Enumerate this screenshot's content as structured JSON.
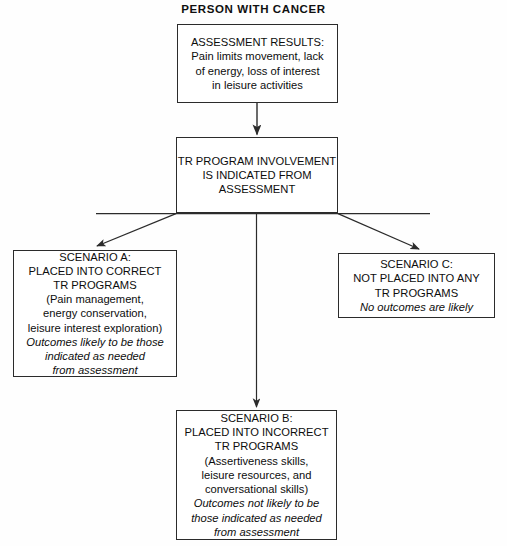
{
  "diagram": {
    "title": "PERSON WITH CANCER",
    "type": "flowchart",
    "nodes": {
      "assessment": {
        "id": "assessment-results",
        "lines": [
          {
            "text": "ASSESSMENT RESULTS:",
            "style": "normal"
          },
          {
            "text": "Pain limits movement, lack",
            "style": "normal"
          },
          {
            "text": "of energy, loss of interest",
            "style": "normal"
          },
          {
            "text": "in leisure activities",
            "style": "normal"
          }
        ]
      },
      "involvement": {
        "id": "tr-program-involvement",
        "lines": [
          {
            "text": "TR PROGRAM INVOLVEMENT",
            "style": "normal"
          },
          {
            "text": "IS INDICATED FROM",
            "style": "normal"
          },
          {
            "text": "ASSESSMENT",
            "style": "normal"
          }
        ]
      },
      "scenario_a": {
        "id": "scenario-a",
        "lines": [
          {
            "text": "SCENARIO A:",
            "style": "normal"
          },
          {
            "text": "PLACED INTO CORRECT",
            "style": "normal"
          },
          {
            "text": "TR PROGRAMS",
            "style": "normal"
          },
          {
            "text": "(Pain management,",
            "style": "normal"
          },
          {
            "text": "energy conservation,",
            "style": "normal"
          },
          {
            "text": "leisure interest exploration)",
            "style": "normal"
          },
          {
            "text": "Outcomes likely to be those",
            "style": "italic"
          },
          {
            "text": "indicated as needed",
            "style": "italic"
          },
          {
            "text": "from assessment",
            "style": "italic"
          }
        ]
      },
      "scenario_b": {
        "id": "scenario-b",
        "lines": [
          {
            "text": "SCENARIO B:",
            "style": "normal"
          },
          {
            "text": "PLACED INTO INCORRECT",
            "style": "normal"
          },
          {
            "text": "TR PROGRAMS",
            "style": "normal"
          },
          {
            "text": "(Assertiveness skills,",
            "style": "normal"
          },
          {
            "text": "leisure resources, and",
            "style": "normal"
          },
          {
            "text": "conversational skills)",
            "style": "normal"
          },
          {
            "text": "Outcomes not likely to be",
            "style": "italic"
          },
          {
            "text": "those indicated as needed",
            "style": "italic"
          },
          {
            "text": "from assessment",
            "style": "italic"
          }
        ]
      },
      "scenario_c": {
        "id": "scenario-c",
        "lines": [
          {
            "text": "SCENARIO C:",
            "style": "normal"
          },
          {
            "text": "NOT PLACED INTO ANY",
            "style": "normal"
          },
          {
            "text": "TR PROGRAMS",
            "style": "normal"
          },
          {
            "text": "No outcomes are likely",
            "style": "italic"
          }
        ]
      }
    },
    "connectors": [
      {
        "name": "assessment-to-involvement",
        "from": "assessment",
        "to": "involvement",
        "shape": "vertical-arrow"
      },
      {
        "name": "involvement-to-scenario-a",
        "from": "involvement",
        "to": "scenario_a",
        "shape": "diagonal-arrow-left"
      },
      {
        "name": "involvement-to-scenario-b",
        "from": "involvement",
        "to": "scenario_b",
        "shape": "vertical-arrow"
      },
      {
        "name": "involvement-to-scenario-c",
        "from": "involvement",
        "to": "scenario_c",
        "shape": "diagonal-arrow-right"
      }
    ],
    "colors": {
      "background": "#fefefe",
      "border": "#2b2b2b",
      "text": "#0d0d0d",
      "connector": "#2b2b2b"
    }
  }
}
